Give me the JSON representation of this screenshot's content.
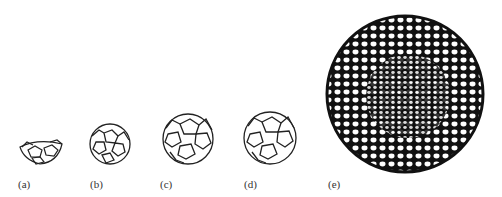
{
  "figure": {
    "panels": [
      {
        "id": "a",
        "label": "(a)",
        "shape": "partial-cage"
      },
      {
        "id": "b",
        "label": "(b)",
        "shape": "small-cage"
      },
      {
        "id": "c",
        "label": "(c)",
        "shape": "medium-cage"
      },
      {
        "id": "d",
        "label": "(d)",
        "shape": "medium-cage"
      },
      {
        "id": "e",
        "label": "(e)",
        "shape": "giant-cage"
      }
    ],
    "colors": {
      "ink": "#111111",
      "background": "#ffffff"
    }
  }
}
